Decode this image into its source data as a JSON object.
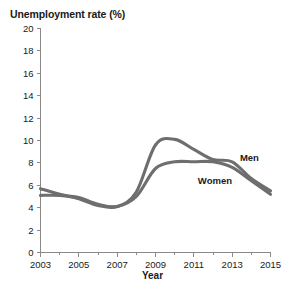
{
  "chart_data": {
    "type": "line",
    "title": "Unemployment rate (%)",
    "xlabel": "Year",
    "ylabel": "Unemployment rate (%)",
    "xlim": [
      2003,
      2015
    ],
    "ylim": [
      0,
      20
    ],
    "ytick_step": 2,
    "grid": false,
    "legend_position": "inline-annotation",
    "line_color": "#6e6e6e",
    "axis_color": "#8a8a8a",
    "x_major_ticks": [
      "2003",
      "2005",
      "2007",
      "2009",
      "2011",
      "2013",
      "2015"
    ],
    "x_minor_ticks": [
      "2004",
      "2006",
      "2008",
      "2010",
      "2012",
      "2014"
    ],
    "y_ticks": [
      "0",
      "2",
      "4",
      "6",
      "8",
      "10",
      "12",
      "14",
      "16",
      "18",
      "20"
    ],
    "x": [
      2003,
      2004,
      2005,
      2006,
      2007,
      2008,
      2009,
      2010,
      2011,
      2012,
      2013,
      2014,
      2015
    ],
    "series": [
      {
        "name": "Men",
        "label": "Men",
        "color": "#6e6e6e",
        "values": [
          5.7,
          5.2,
          4.8,
          4.2,
          4.1,
          5.4,
          9.6,
          10.1,
          9.2,
          8.3,
          8.1,
          6.6,
          5.5
        ]
      },
      {
        "name": "Women",
        "label": "Women",
        "color": "#6e6e6e",
        "values": [
          5.1,
          5.1,
          4.9,
          4.3,
          4.1,
          5.0,
          7.5,
          8.1,
          8.1,
          8.1,
          7.6,
          6.4,
          5.2
        ]
      }
    ],
    "annotations": [
      {
        "text": "Men",
        "x": 2013.9,
        "y": 8.15
      },
      {
        "text": "Women",
        "x": 2012.1,
        "y": 6.1
      }
    ]
  }
}
